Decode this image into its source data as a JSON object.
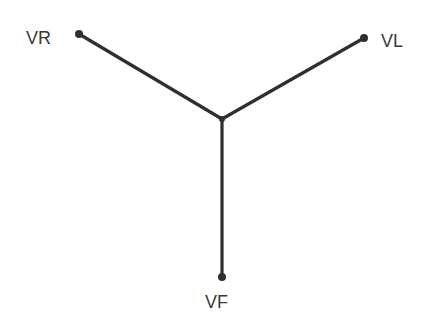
{
  "diagram": {
    "center": {
      "x": 222,
      "y": 119
    },
    "colors": {
      "line": "#2f2f2f",
      "text": "#3a3a3a"
    },
    "nodes": [
      {
        "id": "vr",
        "label": "VR",
        "x": 79,
        "y": 34,
        "label_x": 26,
        "label_y": 44
      },
      {
        "id": "vl",
        "label": "VL",
        "x": 364,
        "y": 38,
        "label_x": 381,
        "label_y": 47
      },
      {
        "id": "vf",
        "label": "VF",
        "x": 222,
        "y": 277,
        "label_x": 205,
        "label_y": 308
      }
    ]
  }
}
